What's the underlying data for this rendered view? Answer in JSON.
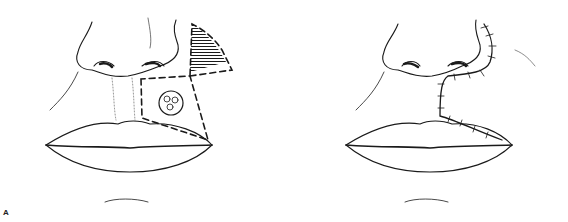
{
  "figure": {
    "label": "A",
    "panels": [
      {
        "id": "before",
        "description": "Upper lip lesion with dashed flap outline and hatched excision triangle at alar crease"
      },
      {
        "id": "after",
        "description": "Flap advanced and sutured along nasolabial fold"
      }
    ],
    "colors": {
      "line": "#1a1a1a",
      "background": "#ffffff"
    }
  }
}
